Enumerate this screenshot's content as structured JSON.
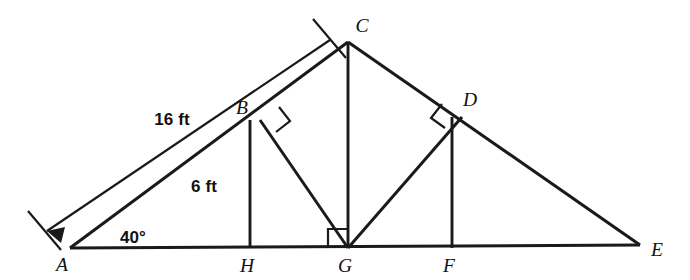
{
  "figure": {
    "type": "geometry-diagram",
    "background_color": "#ffffff",
    "stroke_color": "#1a1a1a"
  },
  "vertices": [
    {
      "id": "A",
      "label": "A",
      "x": 70,
      "y": 248,
      "label_x": 62,
      "label_y": 271
    },
    {
      "id": "B",
      "label": "B",
      "x": 260,
      "y": 120,
      "label_x": 242,
      "label_y": 114
    },
    {
      "id": "C",
      "label": "C",
      "x": 348,
      "y": 42,
      "label_x": 358,
      "label_y": 32
    },
    {
      "id": "D",
      "label": "D",
      "x": 462,
      "y": 117,
      "label_x": 466,
      "label_y": 106
    },
    {
      "id": "E",
      "label": "E",
      "x": 640,
      "y": 245,
      "label_x": 652,
      "label_y": 256
    },
    {
      "id": "F",
      "label": "F",
      "x": 452,
      "y": 248,
      "label_x": 445,
      "label_y": 272
    },
    {
      "id": "G",
      "label": "G",
      "x": 348,
      "y": 248,
      "label_x": 340,
      "label_y": 272
    },
    {
      "id": "H",
      "label": "H",
      "x": 250,
      "y": 248,
      "label_x": 242,
      "label_y": 272
    }
  ],
  "segments": [
    {
      "name": "base-A-E",
      "from": "A",
      "to": "E",
      "style": "outline"
    },
    {
      "name": "slope-A-C",
      "from": "A",
      "to": "C",
      "style": "outline"
    },
    {
      "name": "slope-C-E",
      "from": "C",
      "to": "E",
      "style": "outline"
    },
    {
      "name": "strut-B-G",
      "from": "B",
      "to": "G",
      "style": "inner"
    },
    {
      "name": "strut-D-G",
      "from": "D",
      "to": "G",
      "style": "inner"
    },
    {
      "name": "post-C-G",
      "from": "C",
      "to": "G",
      "style": "vertical"
    },
    {
      "name": "post-B-H",
      "from": "B",
      "to": "H",
      "style": "vertical"
    },
    {
      "name": "post-D-F",
      "from": "D",
      "to": "F",
      "style": "vertical"
    }
  ],
  "right_angle_marks": [
    {
      "name": "right-angle-at-B",
      "vertex": "B"
    },
    {
      "name": "right-angle-at-D",
      "vertex": "D"
    },
    {
      "name": "right-angle-at-G",
      "vertex": "G"
    }
  ],
  "measurements": [
    {
      "name": "length-A-C",
      "text": "16 ft",
      "label_x": 172,
      "label_y": 125,
      "applies_to": "A-C",
      "dimension_line": true,
      "arrow_end": "A"
    },
    {
      "name": "length-B-H",
      "text": "6 ft",
      "label_x": 204,
      "label_y": 192,
      "applies_to": "B-H",
      "dimension_line": false
    }
  ],
  "angles": [
    {
      "name": "angle-at-A",
      "text": "40°",
      "label_x": 120,
      "label_y": 243,
      "vertex": "A",
      "value": 40,
      "unit": "degrees"
    }
  ]
}
